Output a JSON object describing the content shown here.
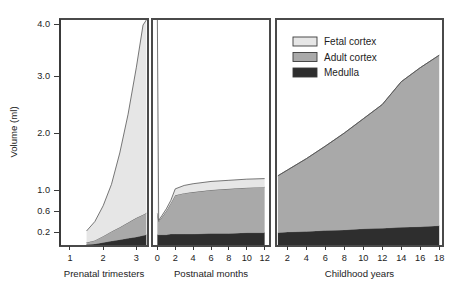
{
  "chart_data": {
    "type": "area",
    "title": "",
    "subtitle": "",
    "xlabel": "",
    "ylabel": "Volume (ml)",
    "grid": false,
    "stacked": true,
    "legend_position": "top-right",
    "ylim": [
      0.0,
      4.2
    ],
    "y_ticks": [
      0.2,
      0.6,
      1.0,
      2.0,
      3.0,
      4.0
    ],
    "y_tick_labels": [
      "0.2",
      "0.6",
      "1.0",
      "2.0",
      "3.0",
      "4.0"
    ],
    "y_axis_note": "Non-linear (compressed above 1.0)",
    "legend": [
      {
        "name": "Fetal cortex",
        "color": "#e6e6e6"
      },
      {
        "name": "Adult cortex",
        "color": "#a9a9a9"
      },
      {
        "name": "Medulla",
        "color": "#2e2e2e"
      }
    ],
    "panels": [
      {
        "id": "prenatal",
        "label": "Prenatal trimesters",
        "x_ticks": [
          1,
          2,
          3
        ],
        "x_tick_labels": [
          "1",
          "2",
          "3"
        ],
        "xlim": [
          0.7,
          3.35
        ],
        "x": [
          1.5,
          1.75,
          2.0,
          2.25,
          2.5,
          2.75,
          3.0,
          3.2,
          3.3
        ],
        "series": [
          {
            "name": "Medulla",
            "values": [
              0.02,
              0.03,
              0.05,
              0.07,
              0.09,
              0.11,
              0.13,
              0.15,
              0.16
            ]
          },
          {
            "name": "Adult cortex",
            "values": [
              0.03,
              0.05,
              0.09,
              0.14,
              0.2,
              0.27,
              0.34,
              0.38,
              0.4
            ]
          },
          {
            "name": "Fetal cortex",
            "values": [
              0.17,
              0.32,
              0.56,
              0.89,
              1.36,
              1.95,
              2.7,
              3.45,
              3.6
            ]
          }
        ],
        "totals": [
          0.22,
          0.4,
          0.7,
          1.1,
          1.65,
          2.33,
          3.17,
          3.98,
          4.16
        ]
      },
      {
        "id": "postnatal",
        "label": "Postnatal months",
        "x_ticks": [
          0,
          2,
          4,
          6,
          8,
          10,
          12
        ],
        "x_tick_labels": [
          "0",
          "2",
          "4",
          "6",
          "8",
          "10",
          "12"
        ],
        "xlim": [
          -0.6,
          12.6
        ],
        "x": [
          0.0,
          0.15,
          0.5,
          1.0,
          1.5,
          2.0,
          3.0,
          4.0,
          6.0,
          8.0,
          10.0,
          12.0
        ],
        "series": [
          {
            "name": "Medulla",
            "values": [
              0.16,
              0.16,
              0.16,
              0.16,
              0.17,
              0.17,
              0.17,
              0.17,
              0.18,
              0.18,
              0.19,
              0.19
            ]
          },
          {
            "name": "Adult cortex",
            "values": [
              0.4,
              0.24,
              0.32,
              0.44,
              0.58,
              0.73,
              0.77,
              0.79,
              0.82,
              0.84,
              0.85,
              0.86
            ]
          },
          {
            "name": "Fetal cortex",
            "values": [
              3.6,
              0.02,
              0.03,
              0.04,
              0.05,
              0.12,
              0.14,
              0.15,
              0.15,
              0.15,
              0.15,
              0.15
            ]
          }
        ],
        "totals": [
          4.16,
          0.42,
          0.51,
          0.64,
          0.8,
          1.02,
          1.08,
          1.11,
          1.15,
          1.17,
          1.19,
          1.2
        ]
      },
      {
        "id": "childhood",
        "label": "Childhood years",
        "x_ticks": [
          2,
          4,
          6,
          8,
          10,
          12,
          14,
          16,
          18
        ],
        "x_tick_labels": [
          "2",
          "4",
          "6",
          "8",
          "10",
          "12",
          "14",
          "16",
          "18"
        ],
        "xlim": [
          0.8,
          18.4
        ],
        "x": [
          1.0,
          2.0,
          4.0,
          6.0,
          8.0,
          10.0,
          12.0,
          14.0,
          16.0,
          18.0
        ],
        "series": [
          {
            "name": "Medulla",
            "values": [
              0.19,
              0.2,
              0.21,
              0.23,
              0.24,
              0.26,
              0.27,
              0.29,
              0.3,
              0.32
            ]
          },
          {
            "name": "Adult cortex",
            "values": [
              1.06,
              1.15,
              1.34,
              1.54,
              1.76,
              1.99,
              2.23,
              2.61,
              2.86,
              3.08
            ]
          },
          {
            "name": "Fetal cortex",
            "values": [
              0.0,
              0.0,
              0.0,
              0.0,
              0.0,
              0.0,
              0.0,
              0.0,
              0.0,
              0.0
            ]
          }
        ],
        "totals": [
          1.25,
          1.35,
          1.55,
          1.77,
          2.0,
          2.25,
          2.5,
          2.9,
          3.16,
          3.4
        ]
      }
    ]
  }
}
